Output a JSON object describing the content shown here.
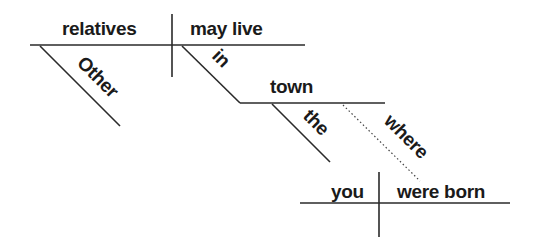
{
  "diagram": {
    "type": "sentence-diagram",
    "sentence": "Other relatives may live in town where you were born",
    "main_clause": {
      "subject": "relatives",
      "verb": "may live",
      "subject_modifier": "Other",
      "prepositional_phrase": {
        "preposition": "in",
        "object": "town",
        "object_modifier": "the"
      }
    },
    "relative_connector": "where",
    "subordinate_clause": {
      "subject": "you",
      "verb": "were born"
    }
  }
}
